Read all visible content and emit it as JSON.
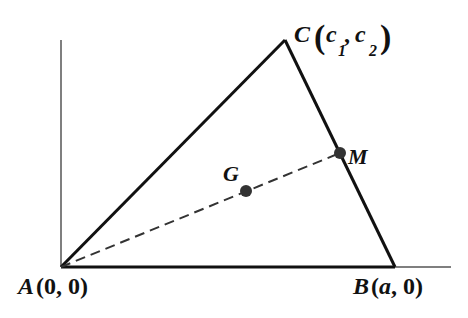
{
  "diagram": {
    "type": "geometry-triangle-median",
    "points": {
      "A": {
        "name": "A",
        "coords": "(0, 0)"
      },
      "B": {
        "name": "B",
        "coords_open": "(",
        "coord_x": "a",
        "coord_sep": ", 0",
        "coords_close": ")"
      },
      "C": {
        "name": "C",
        "c1": "c",
        "c1_sub": "1",
        "c2": "c",
        "c2_sub": "2"
      },
      "G": {
        "name": "G"
      },
      "M": {
        "name": "M"
      }
    },
    "segments": [
      "AB",
      "BC",
      "CA"
    ],
    "dashed": [
      "AM"
    ],
    "axes": [
      "x-axis",
      "y-axis"
    ],
    "colors": {
      "line": "#111111",
      "point": "#333333",
      "axis": "#555555"
    }
  }
}
